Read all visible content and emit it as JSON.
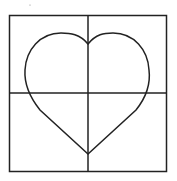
{
  "diagram": {
    "stroke_color": "#222222",
    "background": "#ffffff",
    "grid": {
      "rows": 2,
      "cols": 2
    },
    "shape": "heart"
  }
}
